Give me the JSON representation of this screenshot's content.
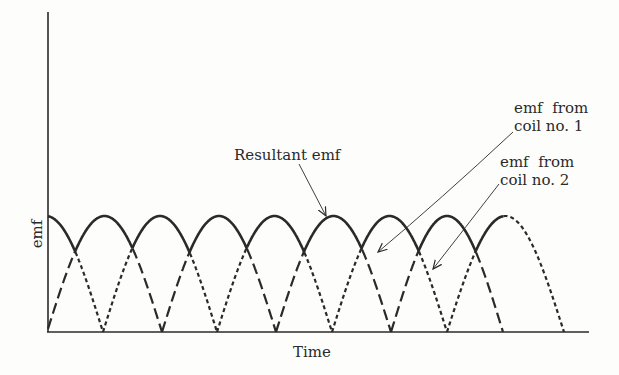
{
  "diagram": {
    "axes": {
      "x_label": "Time",
      "y_label": "emf"
    },
    "annotations": {
      "resultant": "Resultant emf",
      "coil1_line1": "emf  from",
      "coil1_line2": "coil no. 1",
      "coil2_line1": "emf  from",
      "coil2_line2": "coil no. 2"
    },
    "series": [
      {
        "name": "emf from coil no. 1",
        "style": "long-dash",
        "zeros_px": [
          47,
          162,
          276,
          391,
          503
        ]
      },
      {
        "name": "emf from coil no. 2",
        "style": "short-dot",
        "zeros_px": [
          -11,
          103,
          217,
          332,
          447,
          564
        ]
      },
      {
        "name": "Resultant emf",
        "style": "solid",
        "description": "upper envelope of the two rectified sine waves"
      }
    ],
    "colors": {
      "ink": "#2a2a2a",
      "background": "#fdfdfc"
    }
  }
}
